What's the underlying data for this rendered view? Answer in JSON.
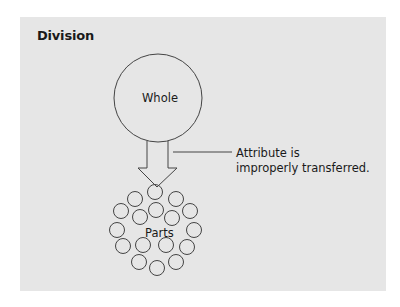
{
  "diagram": {
    "title": "Division",
    "whole_label": "Whole",
    "parts_label": "Parts",
    "annotation": {
      "line1": "Attribute is",
      "line2": "improperly transferred."
    },
    "colors": {
      "panel": "#e6e6e6",
      "stroke": "#444444",
      "text": "#1a1a1a"
    },
    "part_count": 19
  }
}
